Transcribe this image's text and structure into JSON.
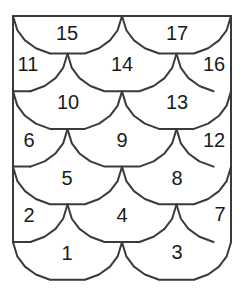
{
  "diagram": {
    "type": "scale-tiling-labeled-regions",
    "frame": {
      "left": 13,
      "right": 231,
      "top": 16
    },
    "stroke_color": "#3a3a3a",
    "text_color": "#1a1a1a",
    "regions": [
      {
        "id": "1",
        "label": "1",
        "x": 67,
        "y": 253
      },
      {
        "id": "2",
        "label": "2",
        "x": 29,
        "y": 215
      },
      {
        "id": "3",
        "label": "3",
        "x": 177,
        "y": 252
      },
      {
        "id": "4",
        "label": "4",
        "x": 122,
        "y": 215
      },
      {
        "id": "5",
        "label": "5",
        "x": 67,
        "y": 178
      },
      {
        "id": "6",
        "label": "6",
        "x": 29,
        "y": 140
      },
      {
        "id": "7",
        "label": "7",
        "x": 220,
        "y": 214
      },
      {
        "id": "8",
        "label": "8",
        "x": 177,
        "y": 178
      },
      {
        "id": "9",
        "label": "9",
        "x": 122,
        "y": 140
      },
      {
        "id": "10",
        "label": "10",
        "x": 68,
        "y": 102
      },
      {
        "id": "11",
        "label": "11",
        "x": 28,
        "y": 64
      },
      {
        "id": "12",
        "label": "12",
        "x": 214,
        "y": 140
      },
      {
        "id": "13",
        "label": "13",
        "x": 177,
        "y": 102
      },
      {
        "id": "14",
        "label": "14",
        "x": 122,
        "y": 64
      },
      {
        "id": "15",
        "label": "15",
        "x": 67,
        "y": 33
      },
      {
        "id": "16",
        "label": "16",
        "x": 214,
        "y": 64
      },
      {
        "id": "17",
        "label": "17",
        "x": 177,
        "y": 33
      }
    ]
  }
}
